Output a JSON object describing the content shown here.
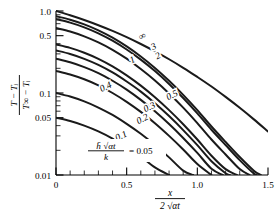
{
  "chart_data": {
    "type": "line",
    "title": "",
    "subtitle": "",
    "xlabel": "x / (2√(αt))",
    "ylabel": "(T − Tᵢ) / (T∞ − Tᵢ)",
    "xscale": "linear",
    "yscale": "log",
    "xlim": [
      0,
      1.5
    ],
    "ylim": [
      0.01,
      1.0
    ],
    "grid": false,
    "legend_position": "inline-curve-labels",
    "x_ticks": [
      "0",
      "0.5",
      "1.0",
      "1.5"
    ],
    "x_tick_values": [
      0,
      0.5,
      1.0,
      1.5
    ],
    "x_minor_tick_values": [
      0.1,
      0.2,
      0.3,
      0.4,
      0.6,
      0.7,
      0.8,
      0.9,
      1.1,
      1.2,
      1.3,
      1.4
    ],
    "y_ticks": [
      "1.0",
      "0.5",
      "0.1",
      "0.05",
      "0.01"
    ],
    "y_tick_values": [
      1.0,
      0.5,
      0.1,
      0.05,
      0.01
    ],
    "y_minor_tick_values": [
      0.9,
      0.8,
      0.7,
      0.6,
      0.4,
      0.3,
      0.2,
      0.09,
      0.08,
      0.07,
      0.06,
      0.04,
      0.03,
      0.02
    ],
    "parameter_name": "h̄√(αt) / k",
    "annotation_formula_numerator": "h̄ √αt",
    "annotation_formula_denominator": "k",
    "annotation_formula_equals": "= 0.05",
    "ylabel_numerator": "T − Tᵢ",
    "ylabel_denominator": "T∞ − Tᵢ",
    "series": [
      {
        "name": "0.05",
        "label": "0.05",
        "label_x": 0.57,
        "label_y": 0.0125,
        "color": "#1a1a1a",
        "points": [
          [
            0,
            0.05
          ],
          [
            0.1,
            0.0455
          ],
          [
            0.2,
            0.04
          ],
          [
            0.3,
            0.034
          ],
          [
            0.4,
            0.0278
          ],
          [
            0.5,
            0.022
          ],
          [
            0.6,
            0.0168
          ],
          [
            0.7,
            0.0124
          ],
          [
            0.8,
            0.01
          ]
        ]
      },
      {
        "name": "0.1",
        "label": "0.1",
        "label_x": 0.47,
        "label_y": 0.0305,
        "color": "#1a1a1a",
        "points": [
          [
            0,
            0.1
          ],
          [
            0.1,
            0.0905
          ],
          [
            0.2,
            0.079
          ],
          [
            0.3,
            0.0665
          ],
          [
            0.4,
            0.054
          ],
          [
            0.5,
            0.042
          ],
          [
            0.6,
            0.0318
          ],
          [
            0.7,
            0.0232
          ],
          [
            0.8,
            0.0164
          ],
          [
            0.9,
            0.0113
          ],
          [
            0.97,
            0.01
          ]
        ]
      },
      {
        "name": "0.2",
        "label": "0.2",
        "label_x": 0.62,
        "label_y": 0.049,
        "color": "#1a1a1a",
        "points": [
          [
            0,
            0.186
          ],
          [
            0.1,
            0.168
          ],
          [
            0.2,
            0.147
          ],
          [
            0.3,
            0.124
          ],
          [
            0.4,
            0.1
          ],
          [
            0.5,
            0.078
          ],
          [
            0.6,
            0.0588
          ],
          [
            0.7,
            0.0428
          ],
          [
            0.8,
            0.03
          ],
          [
            0.9,
            0.0205
          ],
          [
            1.0,
            0.0136
          ],
          [
            1.1,
            0.01
          ]
        ]
      },
      {
        "name": "0.3",
        "label": "0.3",
        "label_x": 0.67,
        "label_y": 0.0685,
        "color": "#1a1a1a",
        "points": [
          [
            0,
            0.262
          ],
          [
            0.1,
            0.237
          ],
          [
            0.2,
            0.207
          ],
          [
            0.3,
            0.175
          ],
          [
            0.4,
            0.141
          ],
          [
            0.5,
            0.11
          ],
          [
            0.6,
            0.0825
          ],
          [
            0.7,
            0.0598
          ],
          [
            0.8,
            0.0418
          ],
          [
            0.9,
            0.0283
          ],
          [
            1.0,
            0.0186
          ],
          [
            1.1,
            0.0119
          ],
          [
            1.18,
            0.01
          ]
        ]
      },
      {
        "name": "0.4",
        "label": "0.4",
        "label_x": 0.36,
        "label_y": 0.121,
        "color": "#1a1a1a",
        "points": [
          [
            0,
            0.33
          ],
          [
            0.1,
            0.299
          ],
          [
            0.2,
            0.261
          ],
          [
            0.3,
            0.22
          ],
          [
            0.4,
            0.178
          ],
          [
            0.5,
            0.138
          ],
          [
            0.6,
            0.104
          ],
          [
            0.7,
            0.075
          ],
          [
            0.8,
            0.0523
          ],
          [
            0.9,
            0.0353
          ],
          [
            1.0,
            0.0231
          ],
          [
            1.1,
            0.0147
          ],
          [
            1.2,
            0.0105
          ],
          [
            1.23,
            0.01
          ]
        ]
      },
      {
        "name": "0.5",
        "label": "0.5",
        "label_x": 0.83,
        "label_y": 0.096,
        "color": "#1a1a1a",
        "points": [
          [
            0,
            0.392
          ],
          [
            0.1,
            0.355
          ],
          [
            0.2,
            0.31
          ],
          [
            0.3,
            0.261
          ],
          [
            0.4,
            0.211
          ],
          [
            0.5,
            0.164
          ],
          [
            0.6,
            0.123
          ],
          [
            0.7,
            0.0888
          ],
          [
            0.8,
            0.0618
          ],
          [
            0.9,
            0.0416
          ],
          [
            1.0,
            0.0271
          ],
          [
            1.1,
            0.0172
          ],
          [
            1.2,
            0.0118
          ],
          [
            1.28,
            0.01
          ]
        ]
      },
      {
        "name": "1",
        "label": "1",
        "label_x": 0.55,
        "label_y": 0.258,
        "color": "#1a1a1a",
        "points": [
          [
            0,
            0.62
          ],
          [
            0.1,
            0.562
          ],
          [
            0.2,
            0.491
          ],
          [
            0.3,
            0.414
          ],
          [
            0.4,
            0.336
          ],
          [
            0.5,
            0.262
          ],
          [
            0.6,
            0.196
          ],
          [
            0.7,
            0.142
          ],
          [
            0.8,
            0.0987
          ],
          [
            0.9,
            0.0663
          ],
          [
            1.0,
            0.043
          ],
          [
            1.1,
            0.0271
          ],
          [
            1.2,
            0.0178
          ],
          [
            1.3,
            0.0118
          ],
          [
            1.37,
            0.01
          ]
        ]
      },
      {
        "name": "2",
        "label": "2",
        "label_x": 0.73,
        "label_y": 0.288,
        "color": "#1a1a1a",
        "points": [
          [
            0,
            0.795
          ],
          [
            0.1,
            0.722
          ],
          [
            0.2,
            0.632
          ],
          [
            0.3,
            0.534
          ],
          [
            0.4,
            0.434
          ],
          [
            0.5,
            0.339
          ],
          [
            0.6,
            0.255
          ],
          [
            0.7,
            0.185
          ],
          [
            0.8,
            0.129
          ],
          [
            0.9,
            0.0868
          ],
          [
            1.0,
            0.0564
          ],
          [
            1.1,
            0.0356
          ],
          [
            1.2,
            0.0232
          ],
          [
            1.3,
            0.0152
          ],
          [
            1.4,
            0.0104
          ],
          [
            1.42,
            0.01
          ]
        ]
      },
      {
        "name": "3",
        "label": "3",
        "label_x": 0.7,
        "label_y": 0.375,
        "color": "#1a1a1a",
        "points": [
          [
            0,
            0.862
          ],
          [
            0.1,
            0.784
          ],
          [
            0.2,
            0.687
          ],
          [
            0.3,
            0.581
          ],
          [
            0.4,
            0.473
          ],
          [
            0.5,
            0.37
          ],
          [
            0.6,
            0.279
          ],
          [
            0.7,
            0.202
          ],
          [
            0.8,
            0.141
          ],
          [
            0.9,
            0.095
          ],
          [
            1.0,
            0.0618
          ],
          [
            1.1,
            0.039
          ],
          [
            1.2,
            0.0253
          ],
          [
            1.3,
            0.0166
          ],
          [
            1.4,
            0.0113
          ],
          [
            1.45,
            0.01
          ]
        ]
      },
      {
        "name": "infinity",
        "label": "∞",
        "label_x": 0.62,
        "label_y": 0.5,
        "color": "#1a1a1a",
        "points": [
          [
            0,
            1.0
          ],
          [
            0.1,
            0.888
          ],
          [
            0.2,
            0.777
          ],
          [
            0.3,
            0.671
          ],
          [
            0.4,
            0.572
          ],
          [
            0.5,
            0.48
          ],
          [
            0.6,
            0.396
          ],
          [
            0.7,
            0.322
          ],
          [
            0.8,
            0.258
          ],
          [
            0.9,
            0.203
          ],
          [
            1.0,
            0.157
          ],
          [
            1.1,
            0.12
          ],
          [
            1.2,
            0.0896
          ],
          [
            1.3,
            0.066
          ],
          [
            1.4,
            0.0477
          ],
          [
            1.5,
            0.0339
          ]
        ]
      }
    ]
  }
}
